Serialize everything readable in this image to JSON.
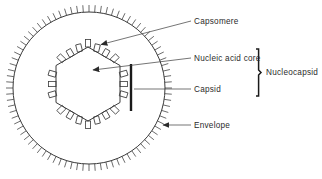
{
  "diagram": {
    "type": "labeled-biological-diagram",
    "background_color": "#ffffff",
    "line_color": "#3a3a3a",
    "text_color": "#2b2b2b"
  },
  "labels": {
    "capsomere": "Capsomere",
    "nucleic_acid_core": "Nucleic acid core",
    "capsid": "Capsid",
    "envelope": "Envelope",
    "nucleocapsid": "Nucleocapsid"
  },
  "structures": {
    "envelope": {
      "shape": "circle",
      "center_x": 89,
      "center_y": 88,
      "radius": 76,
      "spike_count": 84,
      "spike_length": 7
    },
    "capsid": {
      "shape": "hexagon",
      "center_x": 88,
      "center_y": 84,
      "radius": 37,
      "capsomere_count": 18
    },
    "capsid_marker_bar": {
      "x": 131,
      "y_top": 64,
      "y_bottom": 111,
      "width": 2.4
    },
    "nucleocapsid_bracket": {
      "x": 258,
      "y_top": 49,
      "y_bottom": 96
    }
  },
  "leaders": {
    "capsomere": {
      "from_x": 191,
      "from_y": 21,
      "to_x": 99,
      "to_y": 45
    },
    "nucleic_acid_core": {
      "from_x": 191,
      "from_y": 58,
      "to_x": 91,
      "to_y": 70
    },
    "capsid": {
      "from_x": 191,
      "top_y": 89,
      "to_x": 133,
      "to_y": 89
    },
    "envelope": {
      "from_x": 191,
      "from_y": 125,
      "to_x": 161,
      "to_y": 125
    }
  }
}
